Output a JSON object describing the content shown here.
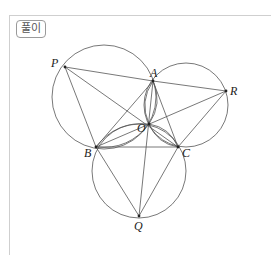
{
  "badge": {
    "label": "풀이"
  },
  "diagram": {
    "points": {
      "P": {
        "label": "P",
        "x": 65,
        "y": 67
      },
      "A": {
        "label": "A",
        "x": 153,
        "y": 81
      },
      "R": {
        "label": "R",
        "x": 226,
        "y": 91
      },
      "O": {
        "label": "O",
        "x": 149,
        "y": 124
      },
      "B": {
        "label": "B",
        "x": 96,
        "y": 147
      },
      "C": {
        "label": "C",
        "x": 178,
        "y": 147
      },
      "Q": {
        "label": "Q",
        "x": 139,
        "y": 216
      }
    },
    "circles": [
      {
        "name": "circle-PAB",
        "cx": 104,
        "cy": 97,
        "r": 52
      },
      {
        "name": "circle-ARC",
        "cx": 186,
        "cy": 105,
        "r": 42
      },
      {
        "name": "circle-BCQ",
        "cx": 139,
        "cy": 171,
        "r": 47
      }
    ],
    "segments": [
      [
        "P",
        "A"
      ],
      [
        "P",
        "B"
      ],
      [
        "P",
        "C"
      ],
      [
        "A",
        "R"
      ],
      [
        "R",
        "C"
      ],
      [
        "R",
        "B"
      ],
      [
        "B",
        "Q"
      ],
      [
        "C",
        "Q"
      ],
      [
        "A",
        "Q"
      ],
      [
        "A",
        "B"
      ],
      [
        "A",
        "C"
      ],
      [
        "B",
        "C"
      ]
    ]
  }
}
